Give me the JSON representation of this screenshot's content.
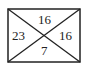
{
  "diagram": {
    "shape": "rectangle with both diagonals",
    "stroke_color": "#222222",
    "regions": {
      "top": "16",
      "left": "23",
      "right": "16",
      "bottom": "7"
    }
  }
}
